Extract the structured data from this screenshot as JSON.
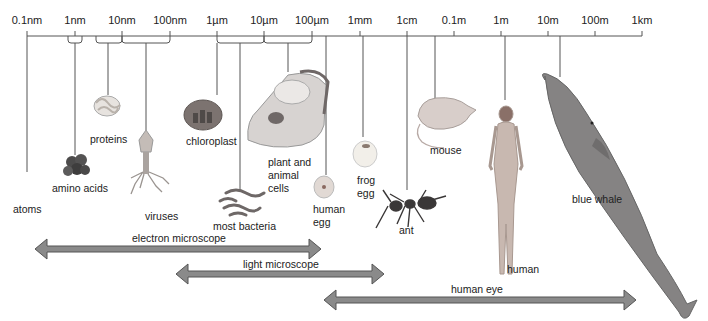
{
  "scale": {
    "ticks": [
      {
        "label": "0.1nm",
        "x": 27
      },
      {
        "label": "1nm",
        "x": 75
      },
      {
        "label": "10nm",
        "x": 122
      },
      {
        "label": "100nm",
        "x": 170
      },
      {
        "label": "1µm",
        "x": 217
      },
      {
        "label": "10µm",
        "x": 264
      },
      {
        "label": "100µm",
        "x": 312
      },
      {
        "label": "1mm",
        "x": 360
      },
      {
        "label": "1cm",
        "x": 407
      },
      {
        "label": "0.1m",
        "x": 454
      },
      {
        "label": "1m",
        "x": 501
      },
      {
        "label": "10m",
        "x": 548
      },
      {
        "label": "100m",
        "x": 595
      },
      {
        "label": "1km",
        "x": 642
      }
    ]
  },
  "items": {
    "atoms": "atoms",
    "amino_acids": "amino acids",
    "proteins": "proteins",
    "viruses": "viruses",
    "chloroplast": "chloroplast",
    "most_bacteria": "most bacteria",
    "cells_1": "plant and",
    "cells_2": "animal",
    "cells_3": "cells",
    "human_egg_1": "human",
    "human_egg_2": "egg",
    "frog_egg_1": "frog",
    "frog_egg_2": "egg",
    "ant": "ant",
    "mouse": "mouse",
    "human": "human",
    "blue_whale": "blue whale"
  },
  "ranges": {
    "electron_microscope": "electron microscope",
    "light_microscope": "light microscope",
    "human_eye": "human eye"
  },
  "colors": {
    "arrow_fill": "#8a8a8a",
    "arrow_stroke": "#555555",
    "line": "#555555"
  }
}
